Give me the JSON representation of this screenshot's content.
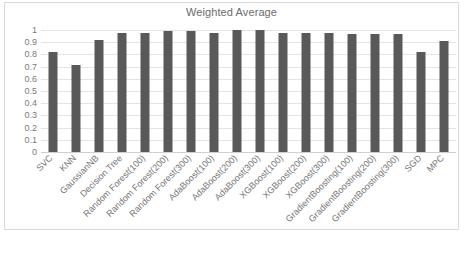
{
  "chart_data": {
    "type": "bar",
    "title": "Weighted Average",
    "xlabel": "",
    "ylabel": "",
    "ylim": [
      0,
      1
    ],
    "ytick_labels": [
      "1",
      "0.9",
      "0.8",
      "0.7",
      "0.6",
      "0.5",
      "0.4",
      "0.3",
      "0.2",
      "0.1",
      "0"
    ],
    "ytick_values": [
      1,
      0.9,
      0.8,
      0.7,
      0.6,
      0.5,
      0.4,
      0.3,
      0.2,
      0.1,
      0
    ],
    "grid": true,
    "legend": false,
    "legend_position": "none",
    "bar_color": "#595959",
    "categories": [
      "SVC",
      "KNN",
      "GaussianNB",
      "Decision Tree",
      "Random Forest(100)",
      "Random Forest(200)",
      "Random Forest(300)",
      "AdaBoost(100)",
      "AdaBoost(200)",
      "AdaBoost(300)",
      "XGBoost(100)",
      "XGBoost(200)",
      "XGBoost(300)",
      "GradientBoosting(100)",
      "GradientBoosting(200)",
      "GradientBoosting(300)",
      "SGD",
      "MPC"
    ],
    "values": [
      0.82,
      0.715,
      0.92,
      0.975,
      0.975,
      0.995,
      0.995,
      0.975,
      1.0,
      1.0,
      0.975,
      0.975,
      0.973,
      0.97,
      0.97,
      0.968,
      0.82,
      0.91
    ]
  },
  "colors": {
    "bar": "#595959",
    "gridline": "#e4e4e4",
    "border": "#d9d9d9",
    "text": "#757575",
    "title": "#6b6b6b",
    "background": "#ffffff"
  }
}
